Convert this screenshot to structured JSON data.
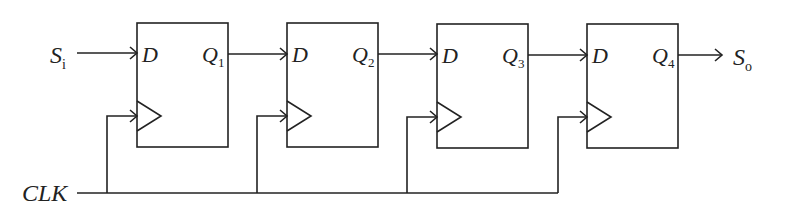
{
  "diagram": {
    "type": "4-bit serial-in serial-out shift register (D flip-flops)",
    "input_label": "S",
    "input_sub": "i",
    "output_label": "S",
    "output_sub": "o",
    "clock_label": "CLK",
    "flip_flops": [
      {
        "d_label": "D",
        "q_label": "Q",
        "q_sub": "1"
      },
      {
        "d_label": "D",
        "q_label": "Q",
        "q_sub": "2"
      },
      {
        "d_label": "D",
        "q_label": "Q",
        "q_sub": "3"
      },
      {
        "d_label": "D",
        "q_label": "Q",
        "q_sub": "4"
      }
    ],
    "line_color": "#222222"
  }
}
